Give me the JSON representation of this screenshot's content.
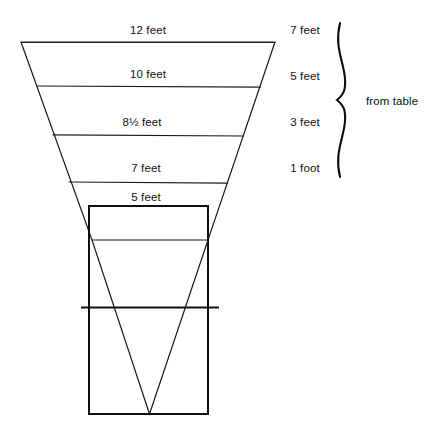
{
  "diagram": {
    "stroke_color": "#1a1a1a",
    "background_color": "#ffffff",
    "inside_labels": [
      {
        "name": "width-12-feet",
        "text": "12 feet",
        "x": 148,
        "y": 30
      },
      {
        "name": "width-10-feet",
        "text": "10 feet",
        "x": 148,
        "y": 74
      },
      {
        "name": "width-8half-feet",
        "text": "8½ feet",
        "x": 142,
        "y": 122
      },
      {
        "name": "width-7-feet",
        "text": "7 feet",
        "x": 146,
        "y": 168
      },
      {
        "name": "width-5-feet",
        "text": "5 feet",
        "x": 146,
        "y": 197
      }
    ],
    "height_labels": [
      {
        "name": "height-7-feet",
        "text": "7 feet",
        "x": 305,
        "y": 30
      },
      {
        "name": "height-5-feet",
        "text": "5 feet",
        "x": 305,
        "y": 76
      },
      {
        "name": "height-3-feet",
        "text": "3 feet",
        "x": 305,
        "y": 122
      },
      {
        "name": "height-1-foot",
        "text": "1 foot",
        "x": 305,
        "y": 168
      }
    ],
    "brace_label": {
      "name": "from-table-label",
      "text": "from table",
      "x": 366,
      "y": 101
    },
    "geometry": {
      "funnel_outline": "M21,42 L275,42 L208,240 L92,240 Z",
      "rules": [
        {
          "name": "rule-top-12ft",
          "x1": 21,
          "y1": 42,
          "x2": 275,
          "y2": 42
        },
        {
          "name": "rule-10ft",
          "x1": 36,
          "y1": 86,
          "x2": 261,
          "y2": 87
        },
        {
          "name": "rule-8half-ft",
          "x1": 52,
          "y1": 135,
          "x2": 244,
          "y2": 136
        },
        {
          "name": "rule-7ft",
          "x1": 68,
          "y1": 182,
          "x2": 228,
          "y2": 183
        }
      ],
      "rectangle": {
        "name": "tank-rectangle",
        "x": 89,
        "y": 206,
        "width": 119,
        "height": 208
      },
      "vee": "M92,240 L149,414 L208,240",
      "water_line": {
        "name": "water-level-line",
        "x1": 81,
        "y1": 307,
        "x2": 219,
        "y2": 307
      },
      "brace": {
        "name": "measurement-brace",
        "x_start": 338,
        "y_top": 23,
        "y_bottom": 177
      }
    }
  }
}
